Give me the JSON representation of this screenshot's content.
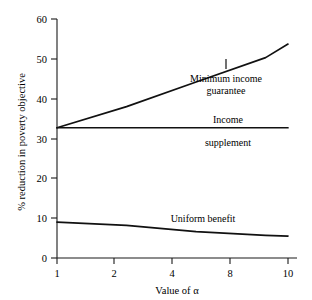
{
  "chart_data": {
    "type": "line",
    "title": "",
    "subtitle": "",
    "xlabel": "Value of α",
    "ylabel": "% reduction in poverty objective",
    "x_scale": "log",
    "x": [
      1,
      2,
      4,
      8,
      10
    ],
    "xtick_labels": [
      "1",
      "2",
      "4",
      "8",
      "10"
    ],
    "xlim": [
      1,
      10
    ],
    "ylim": [
      0,
      60
    ],
    "ytick_labels": [
      "0",
      "10",
      "20",
      "30",
      "40",
      "50",
      "60"
    ],
    "yticks": [
      0,
      10,
      20,
      30,
      40,
      50,
      60
    ],
    "grid": false,
    "legend": "inline-annotations",
    "series": [
      {
        "name": "Minimum income guarantee",
        "values": [
          32.7,
          38.0,
          44.2,
          50.3,
          53.7
        ]
      },
      {
        "name": "Income supplement",
        "values": [
          32.7,
          32.7,
          32.7,
          32.7,
          32.7
        ]
      },
      {
        "name": "Uniform benefit",
        "values": [
          9.0,
          8.2,
          6.6,
          5.7,
          5.5
        ]
      }
    ],
    "annotations": [
      {
        "id": "minimum-income-guarantee",
        "line1": "Minimum income",
        "line2": "guarantee",
        "has_leader": true
      },
      {
        "id": "income-supplement",
        "line1": "Income",
        "line2": "supplement",
        "has_leader": false
      },
      {
        "id": "uniform-benefit",
        "line1": "Uniform benefit",
        "line2": "",
        "has_leader": false
      }
    ]
  }
}
